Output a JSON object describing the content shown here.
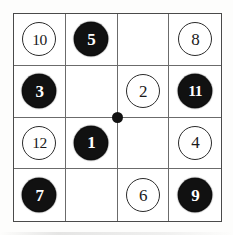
{
  "figure": {
    "type": "grid-token-puzzle",
    "grid": {
      "rows": 4,
      "columns": 4,
      "line_color": "#6b6b6b",
      "border_color": "#4a4a4a",
      "background": "#ffffff"
    },
    "center_marker": {
      "name": "center-dot",
      "color": "#111111",
      "shape": "filled-circle"
    },
    "token_styles": {
      "white": {
        "fill": "#ffffff",
        "outline": "#2b2b2b",
        "text": "#1a1a1a"
      },
      "black": {
        "fill": "#111111",
        "outline": "#0c0c0c",
        "text": "#ffffff"
      }
    },
    "cells": [
      {
        "row": 1,
        "col": 1,
        "label": "10",
        "style": "white"
      },
      {
        "row": 1,
        "col": 2,
        "label": "5",
        "style": "black"
      },
      {
        "row": 1,
        "col": 3,
        "label": "",
        "style": "empty"
      },
      {
        "row": 1,
        "col": 4,
        "label": "8",
        "style": "white"
      },
      {
        "row": 2,
        "col": 1,
        "label": "3",
        "style": "black"
      },
      {
        "row": 2,
        "col": 2,
        "label": "",
        "style": "empty"
      },
      {
        "row": 2,
        "col": 3,
        "label": "2",
        "style": "white"
      },
      {
        "row": 2,
        "col": 4,
        "label": "11",
        "style": "black"
      },
      {
        "row": 3,
        "col": 1,
        "label": "12",
        "style": "white"
      },
      {
        "row": 3,
        "col": 2,
        "label": "1",
        "style": "black"
      },
      {
        "row": 3,
        "col": 3,
        "label": "",
        "style": "empty"
      },
      {
        "row": 3,
        "col": 4,
        "label": "4",
        "style": "white"
      },
      {
        "row": 4,
        "col": 1,
        "label": "7",
        "style": "black"
      },
      {
        "row": 4,
        "col": 2,
        "label": "",
        "style": "empty"
      },
      {
        "row": 4,
        "col": 3,
        "label": "6",
        "style": "white"
      },
      {
        "row": 4,
        "col": 4,
        "label": "9",
        "style": "black"
      }
    ]
  }
}
